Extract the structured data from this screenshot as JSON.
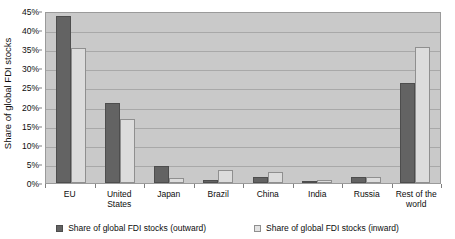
{
  "chart_data": {
    "type": "bar",
    "title": "",
    "xlabel": "",
    "ylabel": "Share of global FDI stocks",
    "ylim": [
      0,
      45
    ],
    "ytick_labels": [
      "45%",
      "40%",
      "35%",
      "30%",
      "25%",
      "20%",
      "15%",
      "10%",
      "5%",
      "0%"
    ],
    "ytick_values": [
      45,
      40,
      35,
      30,
      25,
      20,
      15,
      10,
      5,
      0
    ],
    "grid": true,
    "legend_position": "bottom",
    "categories": [
      "EU",
      "United States",
      "Japan",
      "Brazil",
      "China",
      "India",
      "Russia",
      "Rest of the world"
    ],
    "series": [
      {
        "name": "Share of global FDI stocks (outward)",
        "color": "#636363",
        "values": [
          43.7,
          21.0,
          4.5,
          0.8,
          1.5,
          0.6,
          1.7,
          26.2
        ]
      },
      {
        "name": "Share of global FDI stocks (inward)",
        "color": "#dcdcdc",
        "values": [
          35.4,
          16.8,
          1.3,
          3.3,
          3.0,
          0.9,
          1.6,
          35.5
        ]
      }
    ]
  },
  "legend": {
    "entries": [
      {
        "label": "Share of global FDI stocks (outward)"
      },
      {
        "label": "Share of global FDI stocks (inward)"
      }
    ]
  }
}
